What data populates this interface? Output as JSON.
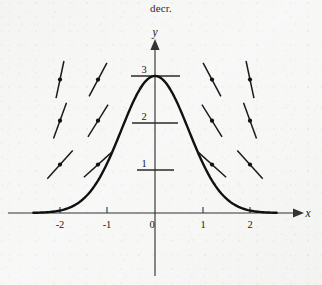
{
  "caption": {
    "text": "decr."
  },
  "axes": {
    "x_label": "x",
    "y_label": "y",
    "x_ticks": [
      {
        "label": "-2",
        "value": -2
      },
      {
        "label": "-1",
        "value": -1
      },
      {
        "label": "0",
        "value": 0
      },
      {
        "label": "1",
        "value": 1
      },
      {
        "label": "2",
        "value": 2
      }
    ],
    "y_ticks": [
      {
        "label": "1",
        "value": 1
      },
      {
        "label": "2",
        "value": 2
      },
      {
        "label": "3",
        "value": 3
      }
    ]
  },
  "chart_data": {
    "type": "line",
    "title": "decr.",
    "xlabel": "x",
    "ylabel": "y",
    "xlim": [
      -2.55,
      2.55
    ],
    "ylim": [
      0,
      3.35
    ],
    "grid": false,
    "legend": null,
    "curve": {
      "name": "solution curve",
      "description": "bell-shaped curve peaking at (0, 3), decreasing toward 0 as |x| grows",
      "formula": "y = 3 e^(-x^2)",
      "x": [
        -2.5,
        -2.25,
        -2.0,
        -1.75,
        -1.5,
        -1.25,
        -1.0,
        -0.75,
        -0.5,
        -0.25,
        0,
        0.25,
        0.5,
        0.75,
        1.0,
        1.25,
        1.5,
        1.75,
        2.0,
        2.25,
        2.5
      ],
      "y": [
        0.21,
        0.3,
        0.42,
        0.58,
        0.78,
        1.02,
        1.3,
        1.62,
        1.96,
        2.3,
        2.62,
        2.86,
        2.98,
        2.96,
        2.8,
        2.52,
        2.15,
        1.74,
        1.34,
        0.98,
        0.68
      ]
    },
    "slope_field": {
      "description": "short tangent segments with a dot at each sample point; slopes point toward the curve",
      "rows_y": [
        2.92,
        2.02,
        1.06
      ],
      "cols_x": [
        -2.0,
        -1.2,
        1.2,
        2.0
      ],
      "points": [
        {
          "x": -2.0,
          "y": 2.92,
          "slope_angle_deg": 78
        },
        {
          "x": -1.2,
          "y": 2.92,
          "slope_angle_deg": 62
        },
        {
          "x": 1.2,
          "y": 2.92,
          "slope_angle_deg": -62
        },
        {
          "x": 2.0,
          "y": 2.92,
          "slope_angle_deg": -78
        },
        {
          "x": -2.0,
          "y": 2.02,
          "slope_angle_deg": 70
        },
        {
          "x": -1.2,
          "y": 2.02,
          "slope_angle_deg": 58
        },
        {
          "x": 1.2,
          "y": 2.02,
          "slope_angle_deg": -58
        },
        {
          "x": 2.0,
          "y": 2.02,
          "slope_angle_deg": -70
        },
        {
          "x": -2.0,
          "y": 1.06,
          "slope_angle_deg": 48
        },
        {
          "x": -1.2,
          "y": 1.06,
          "slope_angle_deg": 42
        },
        {
          "x": 1.2,
          "y": 1.06,
          "slope_angle_deg": -42
        },
        {
          "x": 2.0,
          "y": 1.06,
          "slope_angle_deg": -48
        }
      ]
    }
  }
}
